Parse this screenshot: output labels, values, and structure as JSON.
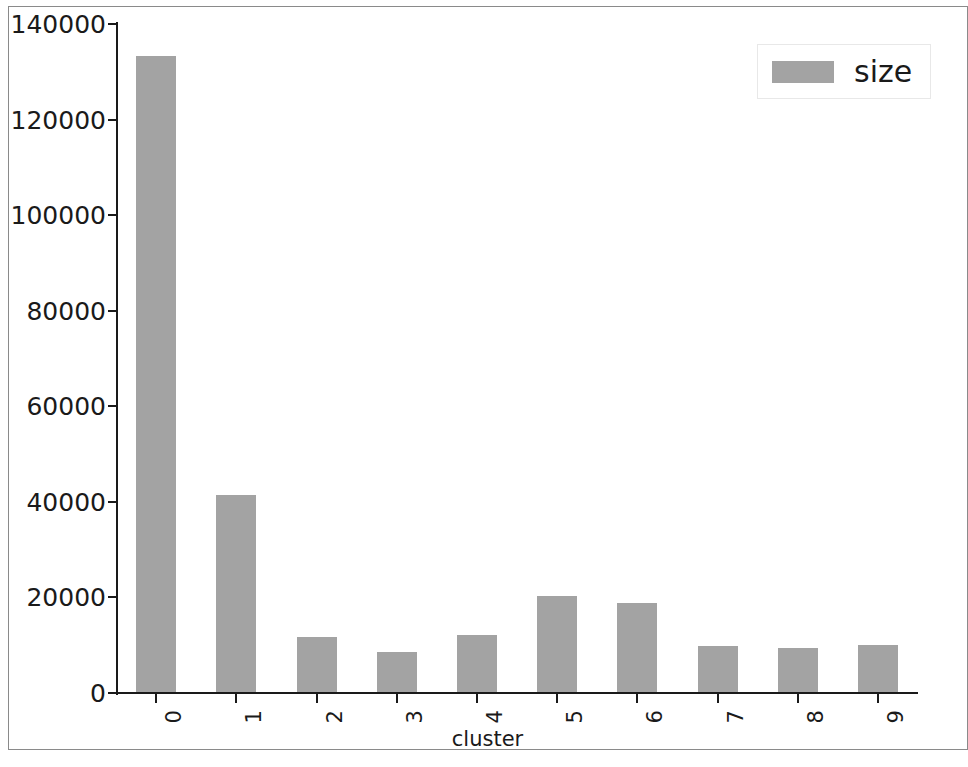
{
  "chart_data": {
    "type": "bar",
    "title": "",
    "xlabel": "cluster",
    "ylabel": "",
    "categories": [
      "0",
      "1",
      "2",
      "3",
      "4",
      "5",
      "6",
      "7",
      "8",
      "9"
    ],
    "values": [
      133400,
      41400,
      11800,
      8500,
      12100,
      20300,
      18900,
      9800,
      9500,
      10100
    ],
    "series": [
      {
        "name": "size",
        "values": [
          133400,
          41400,
          11800,
          8500,
          12100,
          20300,
          18900,
          9800,
          9500,
          10100
        ],
        "color": "#a3a3a3"
      }
    ],
    "ylim": [
      0,
      140000
    ],
    "yticks": [
      0,
      20000,
      40000,
      60000,
      80000,
      100000,
      120000,
      140000
    ],
    "ytick_labels": [
      "0",
      "20000",
      "40000",
      "60000",
      "80000",
      "100000",
      "120000",
      "140000"
    ],
    "xtick_labels": [
      "0",
      "1",
      "2",
      "3",
      "4",
      "5",
      "6",
      "7",
      "8",
      "9"
    ],
    "grid": false,
    "legend": {
      "position": "upper-right",
      "entries": [
        {
          "label": "size",
          "color": "#a3a3a3"
        }
      ]
    }
  },
  "legend": {
    "label": "size"
  },
  "axes": {
    "x_title": "cluster"
  },
  "colors": {
    "bar": "#a3a3a3",
    "axis": "#1a1a1a",
    "frame": "#8a8a8a",
    "background": "#ffffff"
  }
}
